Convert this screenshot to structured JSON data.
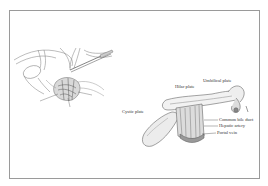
{
  "figure": {
    "left_panel": {
      "description": "surgical-view-illustration",
      "labels": [
        "",
        "",
        ""
      ]
    },
    "right_panel": {
      "description": "hilar-plate-system-illustration",
      "labels": {
        "umbilical_plate": "Umbilical plate",
        "hilar_plate": "Hilar plate",
        "cystic_plate": "Cystic plate",
        "common_bile_duct": "Common bile duct",
        "hepatic_artery": "Hepatic artery",
        "portal_vein": "Portal vein"
      }
    },
    "colors": {
      "frame": "#9a9a9a",
      "line_art": "#6b6b6b",
      "shade": "#b8b8b8"
    }
  }
}
